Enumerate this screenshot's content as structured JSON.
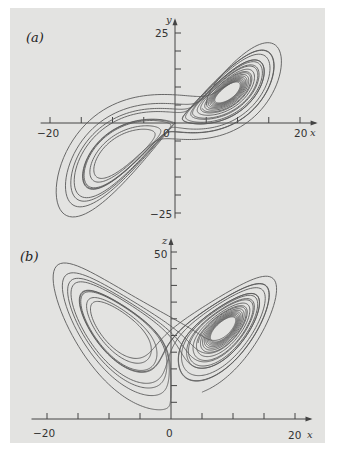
{
  "chart_data": [
    {
      "type": "line",
      "panel_label": "(a)",
      "title": "Lorenz attractor projected on x–y plane",
      "xlabel": "x",
      "ylabel": "y",
      "xlim": [
        -20,
        20
      ],
      "ylim": [
        -25,
        25
      ],
      "x_tick_labels": [
        "−20",
        "0",
        "20"
      ],
      "y_tick_labels": [
        "25",
        "−25"
      ],
      "x_tick_step": 5,
      "y_tick_step": 5,
      "grid": false,
      "legend": null,
      "series": [
        {
          "name": "trajectory",
          "projection": [
            "x",
            "y"
          ]
        }
      ]
    },
    {
      "type": "line",
      "panel_label": "(b)",
      "title": "Lorenz attractor projected on x–z plane",
      "xlabel": "x",
      "ylabel": "z",
      "xlim": [
        -20,
        20
      ],
      "ylim": [
        0,
        50
      ],
      "x_tick_labels": [
        "−20",
        "0",
        "20"
      ],
      "y_tick_labels": [
        "50"
      ],
      "x_tick_step": 5,
      "y_tick_step": 5,
      "grid": false,
      "legend": null,
      "series": [
        {
          "name": "trajectory",
          "projection": [
            "x",
            "z"
          ]
        }
      ]
    }
  ],
  "system": {
    "sigma": 10,
    "rho": 28,
    "beta": 2.6667,
    "initial": [
      5,
      5,
      8
    ],
    "dt": 0.005,
    "steps": 4200
  },
  "colors": {
    "page": "#e3e3e1",
    "axis": "#444444",
    "curve": "#5a5a5a"
  },
  "panels": {
    "a": {
      "label": "(a)",
      "x_axis_name": "x",
      "y_axis_name": "y",
      "tick_neg20": "−20",
      "tick_0": "0",
      "tick_20": "20",
      "tick_y25": "25",
      "tick_yneg25": "−25"
    },
    "b": {
      "label": "(b)",
      "x_axis_name": "x",
      "z_axis_name": "z",
      "tick_neg20": "−20",
      "tick_0": "0",
      "tick_20": "20",
      "tick_z50": "50"
    }
  }
}
